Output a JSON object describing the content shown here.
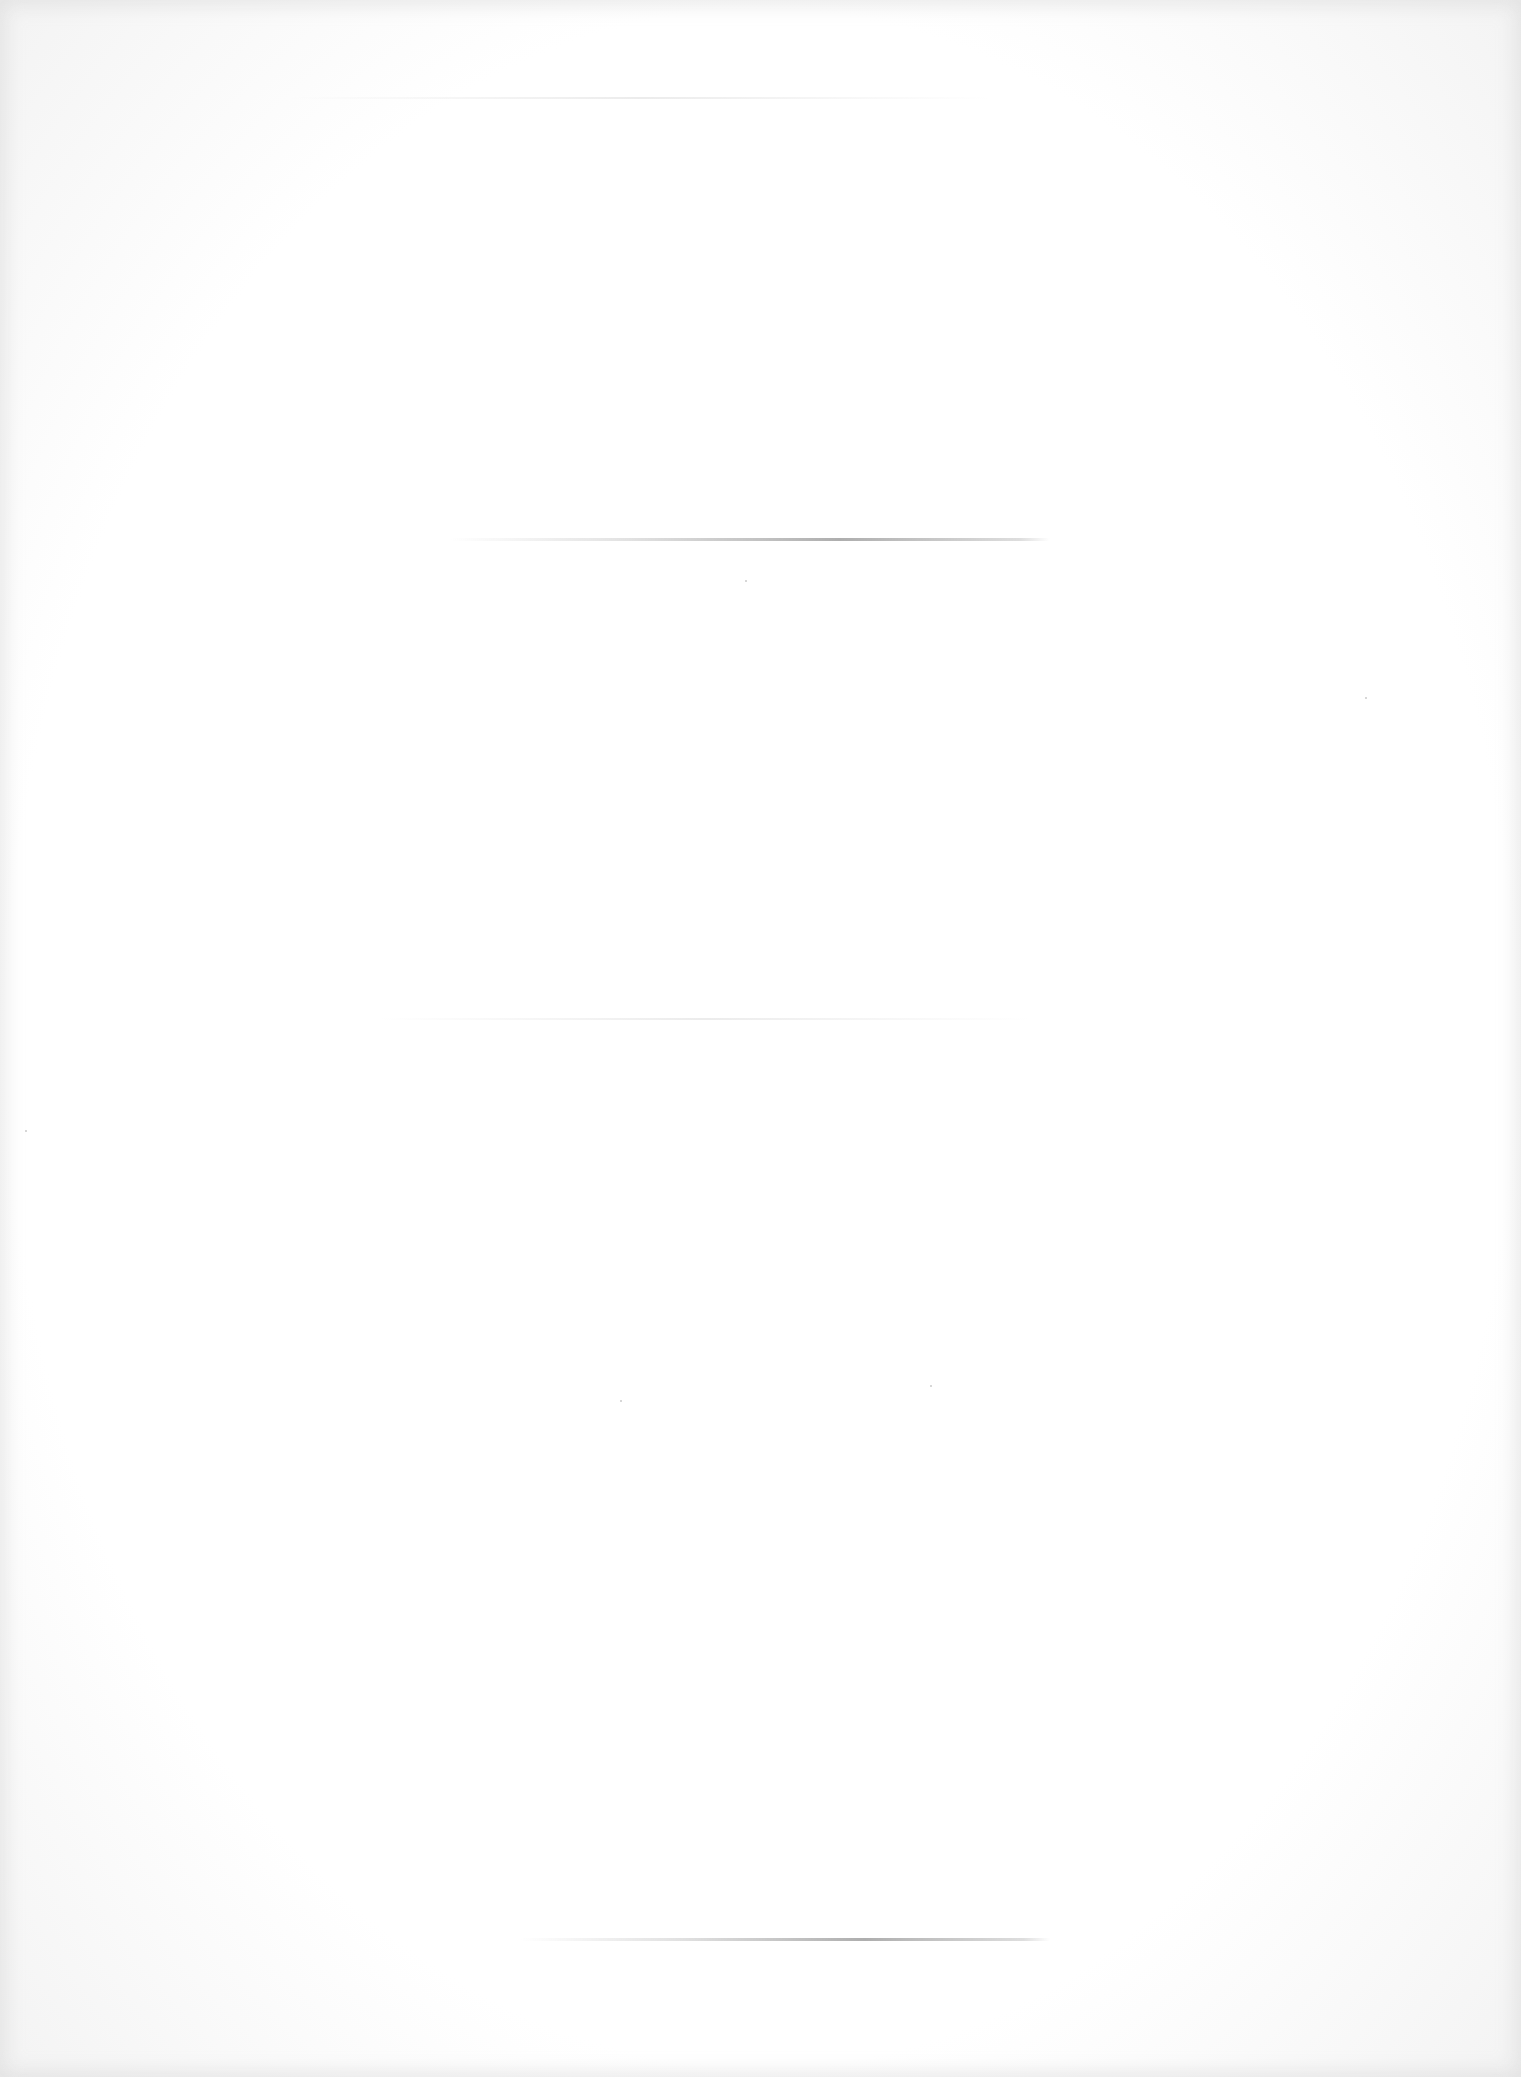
{
  "document": {
    "type": "blank-scanned-page",
    "text": "",
    "marks": [
      {
        "kind": "bleed-through-line",
        "position": "upper",
        "y": 540
      },
      {
        "kind": "bleed-through-line",
        "position": "lower",
        "y": 1940
      },
      {
        "kind": "faint-line",
        "position": "top",
        "y": 95
      },
      {
        "kind": "faint-line",
        "position": "middle",
        "y": 1020
      }
    ]
  }
}
